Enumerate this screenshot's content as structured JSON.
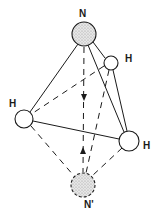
{
  "diagram": {
    "title": "",
    "colors": {
      "ink": "#1a1a1a",
      "nitrogen_fill": "#cfcfcf",
      "hydrogen_fill": "#ffffff"
    },
    "atoms": [
      {
        "id": "N",
        "label": "N",
        "x": 84,
        "y": 34,
        "r": 12,
        "type": "nitrogen"
      },
      {
        "id": "H1",
        "label": "H",
        "x": 111,
        "y": 63,
        "r": 7,
        "type": "hydrogen"
      },
      {
        "id": "H2",
        "label": "H",
        "x": 24,
        "y": 119,
        "r": 9,
        "type": "hydrogen"
      },
      {
        "id": "H3",
        "label": "H",
        "x": 129,
        "y": 141,
        "r": 10,
        "type": "hydrogen"
      },
      {
        "id": "N_prime",
        "label": "N'",
        "x": 83,
        "y": 185,
        "r": 12,
        "type": "nitrogen-inverted"
      }
    ],
    "labels": {
      "n": "N",
      "h_upper": "H",
      "h_left": "H",
      "h_right": "H",
      "n_prime": "N'"
    },
    "bonds_solid": [
      [
        "N",
        "H1"
      ],
      [
        "N",
        "H2"
      ],
      [
        "N",
        "H3"
      ],
      [
        "H1",
        "H3"
      ],
      [
        "H2",
        "H3"
      ]
    ],
    "bonds_dashed": [
      [
        "H1",
        "H2"
      ],
      [
        "H1",
        "N_prime"
      ],
      [
        "H2",
        "N_prime"
      ],
      [
        "H3",
        "N_prime"
      ],
      [
        "N",
        "N_prime"
      ]
    ],
    "arrows": [
      {
        "direction": "down",
        "x": 84,
        "y": 98
      },
      {
        "direction": "up",
        "x": 83,
        "y": 150
      }
    ]
  }
}
